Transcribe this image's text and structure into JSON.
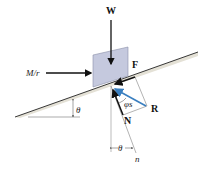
{
  "figure": {
    "type": "free-body diagram",
    "labels": {
      "weight": "W",
      "friction": "F",
      "applied_force": "M/r",
      "resultant": "R",
      "normal": "N",
      "friction_angle": "φs",
      "incline_angle_left": "θ",
      "incline_angle_bottom": "θ",
      "normal_axis": "n"
    },
    "colors": {
      "block_fill": "#c5c9de",
      "block_stroke": "#8a8fa8",
      "resultant_arrow": "#3a7fc0",
      "force_arrows": "#111111",
      "incline_shadow": "#d9d6c8"
    }
  }
}
